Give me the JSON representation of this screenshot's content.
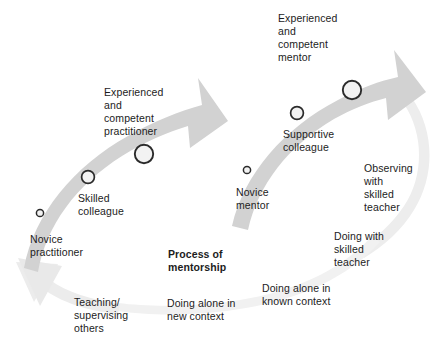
{
  "diagram": {
    "title_label": "Process of\nmentorship",
    "colors": {
      "arrow_main": "#d2d2d2",
      "arrow_faint": "#ededed",
      "circle_fill": "#f2f2f2",
      "circle_stroke": "#2b2b2b",
      "text": "#1c1c1c",
      "background": "#ffffff"
    },
    "left_arc": {
      "name": "practitioner-development-arrow",
      "stages": [
        {
          "label": "Novice\npractitioner",
          "marker": "small-circle"
        },
        {
          "label": "Skilled\ncolleague",
          "marker": "medium-circle"
        },
        {
          "label": "Experienced\nand\ncompetent\npractitioner",
          "marker": "large-circle"
        }
      ]
    },
    "right_arc": {
      "name": "mentor-development-arrow",
      "stages": [
        {
          "label": "Novice\nmentor",
          "marker": "small-circle"
        },
        {
          "label": "Supportive\ncolleague",
          "marker": "medium-circle"
        },
        {
          "label": "Experienced\nand\ncompetent\nmentor",
          "marker": "large-circle"
        }
      ]
    },
    "activity_labels": [
      {
        "label": "Teaching/\nsupervising\nothers"
      },
      {
        "label": "Doing alone in\nnew context"
      },
      {
        "label": "Doing alone in\nknown context"
      },
      {
        "label": "Doing with\nskilled\nteacher"
      },
      {
        "label": "Observing\nwith\nskilled\nteacher"
      }
    ]
  }
}
